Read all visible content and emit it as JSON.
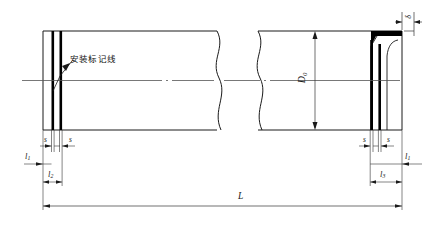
{
  "drawing": {
    "title": "pipe-installation-marking-line-drawing",
    "type": "engineering-dimension-drawing",
    "description": "Longitudinal section of a tube/pipe with break lines, showing installation marking lines near both ends and dimension annotations",
    "colors": {
      "outline": "#1a1a1a",
      "marking_line": "#000000",
      "centerline": "#555555",
      "dimension_line": "#333333",
      "background": "#ffffff"
    },
    "annotation_label": "安装标记线",
    "labels": {
      "diameter": "D",
      "diameter_sub": "0",
      "wall_thickness": "δ",
      "overall_length": "L",
      "marking_width_left_a": "s",
      "marking_width_left_b": "s",
      "marking_width_right_a": "s",
      "marking_width_right_b": "s",
      "offset_left": "l",
      "offset_left_sub": "1",
      "span_left": "l",
      "span_left_sub": "2",
      "offset_right": "l",
      "offset_right_sub": "1",
      "span_right": "l",
      "span_right_sub": "3"
    }
  }
}
